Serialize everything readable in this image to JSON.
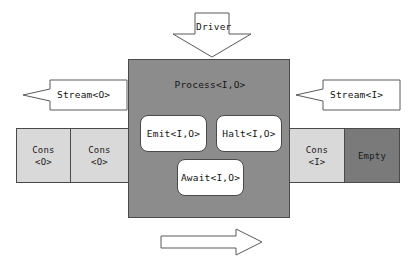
{
  "diagram": {
    "colors": {
      "process_fill": "#8c8c8c",
      "cell_light": "#d9d9d9",
      "cell_dark": "#7a7a7a",
      "node_fill": "#ffffff",
      "outline": "#4a4a4a",
      "arrow_stroke": "#5a5a5a",
      "background": "#ffffff"
    },
    "process": {
      "title": "Process<I,O>",
      "nodes": [
        {
          "id": "emit",
          "label": "Emit<I,O>"
        },
        {
          "id": "halt",
          "label": "Halt<I,O>"
        },
        {
          "id": "await",
          "label": "Await<I,O>"
        }
      ]
    },
    "arrows": {
      "driver": {
        "label": "Driver",
        "direction": "down"
      },
      "stream_out": {
        "label": "Stream<O>",
        "direction": "left"
      },
      "stream_in": {
        "label": "Stream<I>",
        "direction": "left"
      },
      "advance": {
        "label": "",
        "direction": "right"
      }
    },
    "output_stream": {
      "cells": [
        {
          "label_top": "Cons",
          "label_bottom": "<O>",
          "kind": "light"
        },
        {
          "label_top": "Cons",
          "label_bottom": "<O>",
          "kind": "light"
        }
      ]
    },
    "input_stream": {
      "cells": [
        {
          "label_top": "Cons",
          "label_bottom": "<I>",
          "kind": "light"
        },
        {
          "label_top": "Empty",
          "label_bottom": "",
          "kind": "dark"
        }
      ]
    }
  }
}
